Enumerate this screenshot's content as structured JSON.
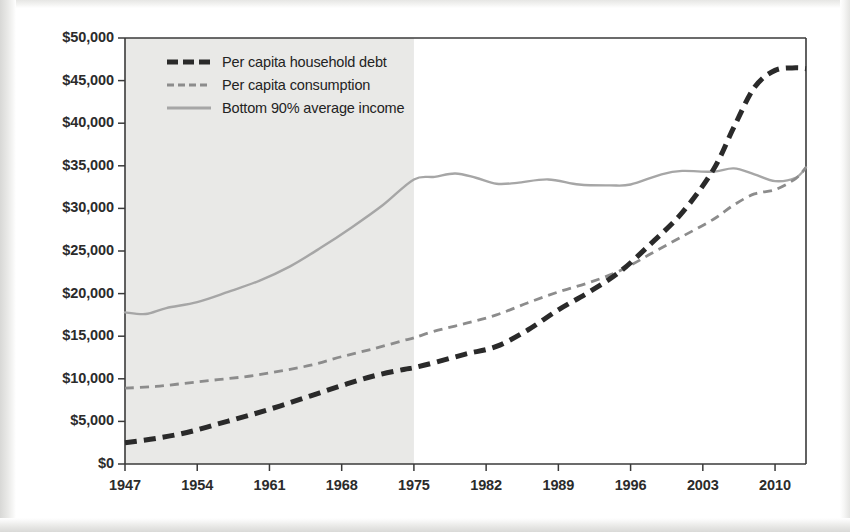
{
  "chart_data": {
    "type": "line",
    "title": "",
    "xlabel": "",
    "ylabel": "",
    "xlim": [
      1947,
      2013
    ],
    "ylim": [
      0,
      50000
    ],
    "grid": false,
    "legend_position": "top-left",
    "y_ticks": [
      "$0",
      "$5,000",
      "$10,000",
      "$15,000",
      "$20,000",
      "$25,000",
      "$30,000",
      "$35,000",
      "$40,000",
      "$45,000",
      "$50,000"
    ],
    "y_tick_values": [
      0,
      5000,
      10000,
      15000,
      20000,
      25000,
      30000,
      35000,
      40000,
      45000,
      50000
    ],
    "x_ticks": [
      "1947",
      "1954",
      "1961",
      "1968",
      "1975",
      "1982",
      "1989",
      "1996",
      "2003",
      "2010"
    ],
    "x_tick_values": [
      1947,
      1954,
      1961,
      1968,
      1975,
      1982,
      1989,
      1996,
      2003,
      2010
    ],
    "shaded_region": {
      "from": 1947,
      "to": 1975,
      "color": "#e9e9e7"
    },
    "series": [
      {
        "name": "Per capita household debt",
        "style": "dashed-thick",
        "color": "#2a2a2a",
        "x": [
          1947,
          1950,
          1953,
          1956,
          1959,
          1962,
          1965,
          1968,
          1971,
          1974,
          1975,
          1977,
          1980,
          1983,
          1986,
          1989,
          1992,
          1995,
          1998,
          2001,
          2004,
          2006,
          2008,
          2010,
          2012,
          2013
        ],
        "values": [
          2500,
          3000,
          3700,
          4700,
          5700,
          6800,
          8000,
          9200,
          10300,
          11100,
          11300,
          11900,
          12900,
          13800,
          15700,
          18100,
          20200,
          22600,
          25900,
          29500,
          34500,
          39500,
          44200,
          46200,
          46500,
          46400
        ]
      },
      {
        "name": "Per capita consumption",
        "style": "dashed-thin",
        "color": "#8c8c8c",
        "x": [
          1947,
          1950,
          1953,
          1956,
          1959,
          1962,
          1965,
          1968,
          1971,
          1974,
          1975,
          1977,
          1980,
          1983,
          1986,
          1989,
          1992,
          1995,
          1998,
          2001,
          2004,
          2006,
          2008,
          2010,
          2012,
          2013
        ],
        "values": [
          8900,
          9100,
          9500,
          9900,
          10300,
          10900,
          11600,
          12600,
          13500,
          14500,
          14800,
          15600,
          16500,
          17500,
          18900,
          20200,
          21300,
          22700,
          24700,
          26700,
          28700,
          30400,
          31700,
          32200,
          33500,
          34800
        ]
      },
      {
        "name": "Bottom 90% average income",
        "style": "solid",
        "color": "#a6a6a6",
        "x": [
          1947,
          1949,
          1951,
          1954,
          1957,
          1960,
          1963,
          1966,
          1969,
          1972,
          1975,
          1977,
          1979,
          1981,
          1983,
          1985,
          1988,
          1991,
          1994,
          1996,
          1999,
          2001,
          2004,
          2006,
          2008,
          2010,
          2012,
          2013
        ],
        "values": [
          17800,
          17600,
          18300,
          19000,
          20200,
          21500,
          23200,
          25400,
          27800,
          30400,
          33400,
          33700,
          34100,
          33600,
          32900,
          33000,
          33400,
          32800,
          32700,
          32800,
          34000,
          34400,
          34300,
          34700,
          34000,
          33200,
          33600,
          34800
        ]
      }
    ]
  },
  "legend": {
    "items": [
      {
        "label": "Per capita household debt",
        "swatch": "dashed-thick-black"
      },
      {
        "label": "Per capita consumption",
        "swatch": "dashed-thin-gray"
      },
      {
        "label": "Bottom 90% average income",
        "swatch": "solid-gray"
      }
    ]
  },
  "colors": {
    "debt": "#2a2a2a",
    "consumption": "#8c8c8c",
    "income": "#a6a6a6",
    "axis": "#3a3a3a",
    "shade": "#e9e9e7",
    "background": "#ffffff"
  }
}
